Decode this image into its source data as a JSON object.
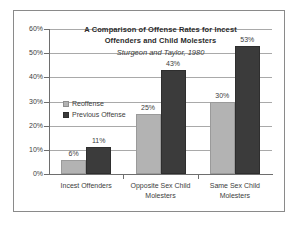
{
  "chart_data": {
    "type": "bar",
    "title": "A Comparison of Offense Rates for Incest Offenders and Child Molesters",
    "title_line1": "A Comparison of Offense Rates for Incest",
    "title_line2": "Offenders and Child Molesters",
    "subtitle": "Sturgeon and Taylor, 1980",
    "xlabel": "",
    "ylabel": "",
    "ylim": [
      0,
      60
    ],
    "y_tick_step": 10,
    "y_tick_labels": [
      "0%",
      "10%",
      "20%",
      "30%",
      "40%",
      "50%",
      "60%"
    ],
    "y_tick_values": [
      0,
      10,
      20,
      30,
      40,
      50,
      60
    ],
    "grid": true,
    "grid_axis": "y",
    "legend_position": "inside-upper-left",
    "categories": [
      "Incest Offenders",
      "Opposite Sex Child Molesters",
      "Same Sex Child Molesters"
    ],
    "category_lines": [
      [
        "Incest Offenders"
      ],
      [
        "Opposite Sex Child",
        "Molesters"
      ],
      [
        "Same Sex Child",
        "Molesters"
      ]
    ],
    "series": [
      {
        "name": "Reoffense",
        "color": "#b3b3b3",
        "values": [
          6,
          25,
          30
        ],
        "labels": [
          "6%",
          "25%",
          "30%"
        ]
      },
      {
        "name": "Previous Offense",
        "color": "#3b3b3b",
        "values": [
          11,
          43,
          53
        ],
        "labels": [
          "11%",
          "43%",
          "53%"
        ]
      }
    ]
  },
  "colors": {
    "reoffense": "#b3b3b3",
    "previous_offense": "#3b3b3b",
    "gridline": "#a9a9a9",
    "axis": "#6e6e6e",
    "frame_border": "#8a8a8a",
    "text": "#3d3d3d",
    "background": "#ffffff"
  }
}
